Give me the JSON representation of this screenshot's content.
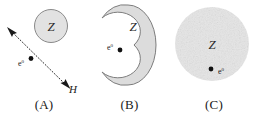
{
  "figure": {
    "panels": [
      {
        "id": "A",
        "caption": "(A)",
        "nucleus_label": "Z",
        "electron_label": "e",
        "electron_superscript": "0",
        "field_label": "H",
        "shape": "small-circle-with-dotted-trajectory",
        "nucleus_fill": "#e2e2e2",
        "nucleus_stroke": "#8a8a8a"
      },
      {
        "id": "B",
        "caption": "(B)",
        "nucleus_label": "Z",
        "electron_label": "e",
        "electron_superscript": "0",
        "shape": "crescent-disk",
        "nucleus_fill": "#dcdcdc",
        "nucleus_stroke": "#7d7d7d"
      },
      {
        "id": "C",
        "caption": "(C)",
        "nucleus_label": "Z",
        "electron_label": "e",
        "electron_superscript": "0",
        "shape": "large-stippled-circle",
        "nucleus_fill": "#e6e6e6",
        "nucleus_stroke": "none"
      }
    ]
  },
  "colors": {
    "background": "#ffffff",
    "ink": "#1a1a1a",
    "gray_fill": "#e2e2e2",
    "gray_stroke": "#8a8a8a"
  }
}
